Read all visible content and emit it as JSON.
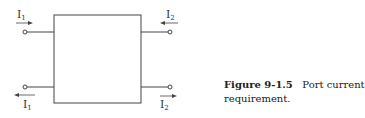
{
  "diagram": {
    "labels": {
      "left_top": {
        "main": "I",
        "sub": "1",
        "arrow": "right"
      },
      "left_bottom": {
        "main": "I",
        "sub": "1",
        "arrow": "left"
      },
      "right_top": {
        "main": "I",
        "sub": "2",
        "arrow": "left"
      },
      "right_bottom": {
        "main": "I",
        "sub": "2",
        "arrow": "right"
      }
    }
  },
  "caption": {
    "figure_label": "Figure 9-1.5",
    "line1": "Port current",
    "line2": "requirement."
  }
}
